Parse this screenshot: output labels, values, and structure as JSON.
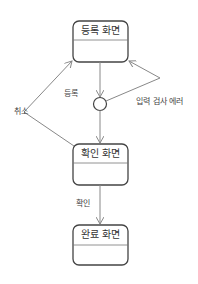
{
  "diagram": {
    "type": "state-machine",
    "colors": {
      "stroke": "#444444",
      "edge": "#888888",
      "text": "#333333"
    },
    "states": [
      {
        "id": "register",
        "label": "등록 화면"
      },
      {
        "id": "confirm",
        "label": "확인 화면"
      },
      {
        "id": "complete",
        "label": "완료 화면"
      }
    ],
    "choice": {
      "id": "choice",
      "shape": "circle"
    },
    "transitions": [
      {
        "from": "register",
        "to": "choice",
        "label": "등록"
      },
      {
        "from": "choice",
        "to": "register",
        "label": "입력 검사 에러"
      },
      {
        "from": "choice",
        "to": "confirm",
        "label": ""
      },
      {
        "from": "confirm",
        "to": "register",
        "label": "취소"
      },
      {
        "from": "confirm",
        "to": "complete",
        "label": "확인"
      }
    ]
  }
}
